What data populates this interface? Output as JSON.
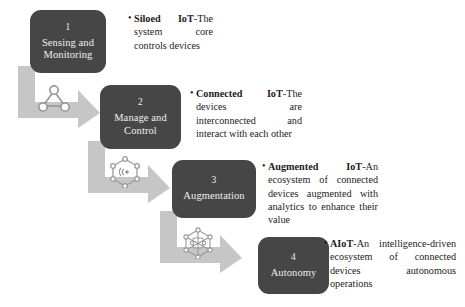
{
  "diagram": {
    "accent_box_color": "#464646",
    "arrow_color": "#c6c6c6",
    "text_color": "#1b1b1b",
    "stages": [
      {
        "number": "1",
        "label": "Sensing and Monitoring",
        "icon": "network-triangle-icon"
      },
      {
        "number": "2",
        "label": "Manage and Control",
        "icon": "network-hexagon-wifi-icon"
      },
      {
        "number": "3",
        "label": "Augmentation",
        "icon": "network-mesh-icon"
      },
      {
        "number": "4",
        "label": "Autonomy",
        "icon": "network-mesh-dense-icon"
      }
    ],
    "descriptions": [
      {
        "bullet": "•",
        "term": "Siloed IoT",
        "separator": "-",
        "body": "The system core controls devices"
      },
      {
        "bullet": "•",
        "term": "Connected IoT",
        "separator": "-",
        "body": "The devices are interconnected and interact with each other"
      },
      {
        "bullet": "•",
        "term": "Augmented IoT",
        "separator": "-",
        "body": "An ecosystem of connected devices augmented with analytics to enhance their value"
      },
      {
        "bullet": "•",
        "term": "AIoT",
        "separator": "-",
        "body": "An intelligence-driven ecosystem of connected devices autonomous operations"
      }
    ]
  }
}
